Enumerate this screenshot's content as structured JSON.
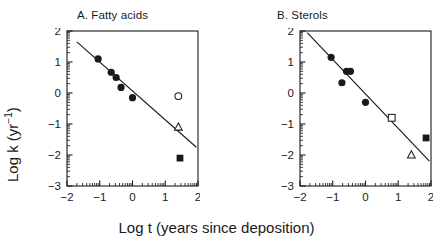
{
  "figure": {
    "background": "#ffffff",
    "foreground": "#1a1a1a",
    "xlabel": "Log t (years since deposition)",
    "ylabel_main": "Log k (yr",
    "ylabel_sup": "−1",
    "ylabel_close": ")",
    "ylabel_full": "Log k (yr⁻¹)"
  },
  "chart_data": [
    {
      "type": "scatter",
      "title": "A. Fatty acids",
      "panel": "A",
      "xlabel": "Log t (years since deposition)",
      "ylabel": "Log k (yr⁻¹)",
      "xlim": [
        -2,
        2
      ],
      "ylim": [
        -3,
        2
      ],
      "xticks": [
        -2,
        -1,
        0,
        1,
        2
      ],
      "xticklabels": [
        "−2",
        "−1",
        "0",
        "1",
        "2"
      ],
      "yticks": [
        -3,
        -2,
        -1,
        0,
        1,
        2
      ],
      "yticklabels": [
        "−3",
        "−2",
        "−1",
        "0",
        "1",
        "2"
      ],
      "minor_ticks": "log-decade",
      "grid": false,
      "legend": null,
      "series": [
        {
          "name": "filled-circle",
          "marker": "filled-circle",
          "points": [
            {
              "x": -1.05,
              "y": 1.1
            },
            {
              "x": -0.65,
              "y": 0.67
            },
            {
              "x": -0.5,
              "y": 0.5
            },
            {
              "x": -0.35,
              "y": 0.18
            },
            {
              "x": 0.0,
              "y": -0.15
            }
          ]
        },
        {
          "name": "open-circle",
          "marker": "open-circle",
          "points": [
            {
              "x": 1.4,
              "y": -0.1
            }
          ]
        },
        {
          "name": "open-triangle",
          "marker": "open-triangle",
          "points": [
            {
              "x": 1.4,
              "y": -1.1
            }
          ]
        },
        {
          "name": "filled-square",
          "marker": "filled-square",
          "points": [
            {
              "x": 1.45,
              "y": -2.1
            }
          ]
        }
      ],
      "fit_line": {
        "name": "regression-line",
        "x1": -1.7,
        "y1": 1.65,
        "x2": 1.95,
        "y2": -1.75
      }
    },
    {
      "type": "scatter",
      "title": "B. Sterols",
      "panel": "B",
      "xlabel": "Log t (years since deposition)",
      "ylabel": "Log k (yr⁻¹)",
      "xlim": [
        -2,
        2
      ],
      "ylim": [
        -3,
        2
      ],
      "xticks": [
        -2,
        -1,
        0,
        1,
        2
      ],
      "xticklabels": [
        "−2",
        "−1",
        "0",
        "1",
        "2"
      ],
      "yticks": [
        -3,
        -2,
        -1,
        0,
        1,
        2
      ],
      "yticklabels": [
        "−3",
        "−2",
        "−1",
        "0",
        "1",
        "2"
      ],
      "minor_ticks": "log-decade",
      "grid": false,
      "legend": null,
      "series": [
        {
          "name": "filled-circle",
          "marker": "filled-circle",
          "points": [
            {
              "x": -1.05,
              "y": 1.15
            },
            {
              "x": -0.72,
              "y": 0.33
            },
            {
              "x": -0.58,
              "y": 0.7
            },
            {
              "x": -0.46,
              "y": 0.7
            },
            {
              "x": 0.0,
              "y": -0.3
            }
          ]
        },
        {
          "name": "open-square",
          "marker": "open-square",
          "points": [
            {
              "x": 0.8,
              "y": -0.8
            }
          ]
        },
        {
          "name": "open-triangle",
          "marker": "open-triangle",
          "points": [
            {
              "x": 1.4,
              "y": -2.0
            }
          ]
        },
        {
          "name": "filled-square",
          "marker": "filled-square",
          "points": [
            {
              "x": 1.85,
              "y": -1.45
            }
          ]
        }
      ],
      "fit_line": {
        "name": "regression-line",
        "x1": -1.78,
        "y1": 1.95,
        "x2": 1.95,
        "y2": -2.2
      }
    }
  ]
}
